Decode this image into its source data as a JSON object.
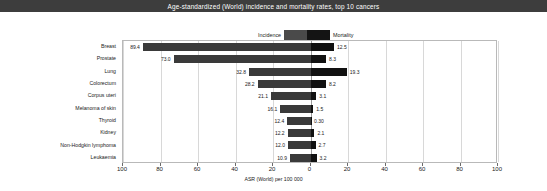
{
  "title": "Age-standardized (World) incidence and mortality rates, top 10 cancers",
  "legend": {
    "incidence_label": "Incidence",
    "mortality_label": "Mortality",
    "incidence_color": "#4a4a4a",
    "mortality_color": "#141414"
  },
  "axis": {
    "title": "ASR (World) per 100 000",
    "tick_labels": [
      "100",
      "80",
      "60",
      "40",
      "20",
      "0",
      "20",
      "40",
      "60",
      "80",
      "100"
    ],
    "tick_values": [
      -100,
      -80,
      -60,
      -40,
      -20,
      0,
      20,
      40,
      60,
      80,
      100
    ],
    "min": -100,
    "max": 100
  },
  "chart_data": {
    "type": "bar",
    "title": "Age-standardized (World) incidence and mortality rates, top 10 cancers",
    "subtype": "diverging-horizontal-bar",
    "xlabel": "ASR (World) per 100 000",
    "ylabel": "",
    "xlim": [
      -100,
      100
    ],
    "grid": true,
    "legend_position": "top-center",
    "categories": [
      "Breast",
      "Prostate",
      "Lung",
      "Colorectum",
      "Corpus uteri",
      "Melanoma of skin",
      "Thyroid",
      "Kidney",
      "Non-Hodgkin lymphoma",
      "Leukaemia"
    ],
    "series": [
      {
        "name": "Incidence",
        "side": "left",
        "color": "#3a3a3a",
        "values": [
          89.4,
          73.0,
          32.8,
          28.2,
          21.1,
          16.1,
          12.4,
          12.2,
          12.0,
          10.9
        ],
        "value_labels": [
          "89.4",
          "73.0",
          "32.8",
          "28.2",
          "21.1",
          "16.1",
          "12.4",
          "12.2",
          "12.0",
          "10.9"
        ]
      },
      {
        "name": "Mortality",
        "side": "right",
        "color": "#111111",
        "values": [
          12.5,
          8.3,
          19.3,
          8.2,
          3.1,
          1.5,
          0.3,
          2.1,
          2.7,
          3.2
        ],
        "value_labels": [
          "12.5",
          "8.3",
          "19.3",
          "8.2",
          "3.1",
          "1.5",
          "0.30",
          "2.1",
          "2.7",
          "3.2"
        ]
      }
    ]
  }
}
